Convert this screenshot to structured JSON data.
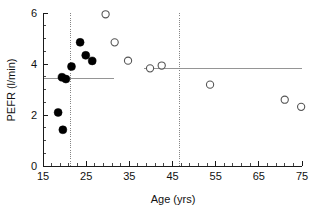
{
  "chart_data": {
    "type": "scatter",
    "title": "",
    "xlabel": "Age (yrs)",
    "ylabel": "PEFR (l/min)",
    "xlim": [
      15,
      75
    ],
    "ylim": [
      0,
      6
    ],
    "grid": false,
    "legend_position": "none",
    "x_ticks": [
      15,
      25,
      35,
      45,
      55,
      65,
      75
    ],
    "x_tick_labels": [
      "15",
      "25",
      "35",
      "45",
      "55",
      "65",
      "75"
    ],
    "x_minor_step": 2,
    "y_ticks": [
      0,
      2,
      4,
      6
    ],
    "y_tick_labels": [
      "0",
      "2",
      "4",
      "6"
    ],
    "y_minor_step": 0.5,
    "series": [
      {
        "name": "filled-group",
        "marker": "filled-circle",
        "color": "#000000",
        "points": [
          {
            "x": 18.5,
            "y": 2.1
          },
          {
            "x": 19.6,
            "y": 1.42
          },
          {
            "x": 19.4,
            "y": 3.48
          },
          {
            "x": 20.3,
            "y": 3.41
          },
          {
            "x": 21.6,
            "y": 3.9
          },
          {
            "x": 23.6,
            "y": 4.85
          },
          {
            "x": 24.9,
            "y": 4.34
          },
          {
            "x": 26.4,
            "y": 4.12
          }
        ]
      },
      {
        "name": "open-group",
        "marker": "open-circle",
        "color": "#555555",
        "points": [
          {
            "x": 29.5,
            "y": 5.95
          },
          {
            "x": 31.6,
            "y": 4.85
          },
          {
            "x": 34.7,
            "y": 4.13
          },
          {
            "x": 39.8,
            "y": 3.83
          },
          {
            "x": 42.5,
            "y": 3.94
          },
          {
            "x": 53.7,
            "y": 3.19
          },
          {
            "x": 71.0,
            "y": 2.6
          },
          {
            "x": 74.8,
            "y": 2.32
          }
        ]
      }
    ],
    "reference_lines": [
      {
        "name": "vertical-cut-left",
        "orientation": "vertical",
        "x": 21.3,
        "style": "dotted",
        "color": "#777777"
      },
      {
        "name": "vertical-cut-right",
        "orientation": "vertical",
        "x": 46.7,
        "style": "dotted",
        "color": "#777777"
      },
      {
        "name": "mean-left-segment",
        "orientation": "horizontal",
        "y": 3.45,
        "x_start": 15.0,
        "x_end": 31.5,
        "style": "solid",
        "color": "#8a8a8a"
      },
      {
        "name": "mean-right-segment",
        "orientation": "horizontal",
        "y": 3.84,
        "x_start": 38.5,
        "x_end": 75.0,
        "style": "solid",
        "color": "#8a8a8a"
      }
    ]
  },
  "axes": {
    "x_title": "Age (yrs)",
    "y_title": "PEFR (l/min)"
  }
}
